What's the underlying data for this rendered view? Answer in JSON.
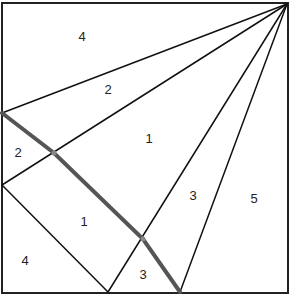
{
  "diagram": {
    "type": "geometric-dissection",
    "border": {
      "x": 2,
      "y": 3,
      "w": 286,
      "h": 290
    },
    "apex": [
      287,
      4
    ],
    "thick_path_color": "#555555",
    "line_color": "#111111",
    "regions": [
      {
        "id": "r_top",
        "label": "4",
        "x": 82,
        "y": 38
      },
      {
        "id": "r_upper_band",
        "label": "2",
        "x": 108,
        "y": 91
      },
      {
        "id": "r_center",
        "label": "1",
        "x": 149,
        "y": 140
      },
      {
        "id": "r_left_small",
        "label": "2",
        "x": 18,
        "y": 154
      },
      {
        "id": "r_narrow",
        "label": "3",
        "x": 193,
        "y": 197
      },
      {
        "id": "r_right",
        "label": "5",
        "x": 254,
        "y": 200
      },
      {
        "id": "r_lower_center",
        "label": "1",
        "x": 84,
        "y": 223
      },
      {
        "id": "r_bottom_left",
        "label": "4",
        "x": 25,
        "y": 262
      },
      {
        "id": "r_bottom_small",
        "label": "3",
        "x": 143,
        "y": 276
      }
    ]
  }
}
